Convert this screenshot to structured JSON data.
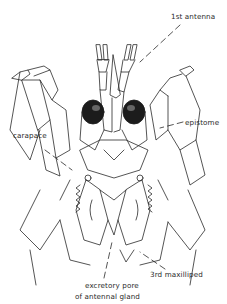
{
  "figure": {
    "labels": {
      "first_antenna": "1st antenna",
      "carapace": "carapace",
      "epistome": "epistome",
      "third_maxilliped": "3rd maxilliped",
      "excretory_pore_line1": "excretory pore",
      "excretory_pore_line2": "of antennal gland"
    },
    "colors": {
      "ink": "#2a2a2a",
      "eye_shade": "#1c1c1c",
      "background": "#ffffff"
    }
  }
}
